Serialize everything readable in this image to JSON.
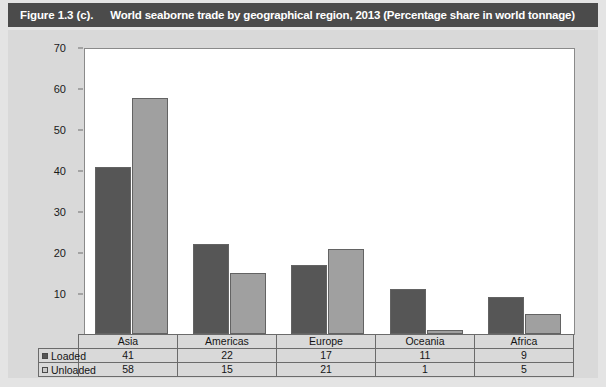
{
  "header": {
    "figure_number": "Figure 1.3 (c).",
    "title": "World seaborne trade by geographical region, 2013 (Percentage share in world tonnage)",
    "bar_color": "#4b4b4b",
    "text_color": "#ffffff"
  },
  "chart_data": {
    "type": "bar",
    "title": "World seaborne trade by geographical region, 2013 (Percentage share in world tonnage)",
    "xlabel": "",
    "ylabel": "",
    "categories": [
      "Asia",
      "Americas",
      "Europe",
      "Oceania",
      "Africa"
    ],
    "series": [
      {
        "name": "Loaded",
        "values": [
          41,
          22,
          17,
          11,
          9
        ],
        "color": "#565656"
      },
      {
        "name": "Unloaded",
        "values": [
          58,
          15,
          21,
          1,
          5
        ],
        "color": "#a0a0a0"
      }
    ],
    "ylim": [
      0,
      70
    ],
    "yticks": [
      "-",
      "10",
      "20",
      "30",
      "40",
      "50",
      "60",
      "70"
    ],
    "ytick_values": [
      0,
      10,
      20,
      30,
      40,
      50,
      60,
      70
    ],
    "grid": false,
    "legend_position": "table-row-labels"
  },
  "table": {
    "row_labels": [
      "Loaded",
      "Unloaded"
    ],
    "columns": [
      "Asia",
      "Americas",
      "Europe",
      "Oceania",
      "Africa"
    ],
    "rows": [
      {
        "label": "Loaded",
        "values": [
          "41",
          "22",
          "17",
          "11",
          "9"
        ]
      },
      {
        "label": "Unloaded",
        "values": [
          "58",
          "15",
          "21",
          "1",
          "5"
        ]
      }
    ]
  }
}
